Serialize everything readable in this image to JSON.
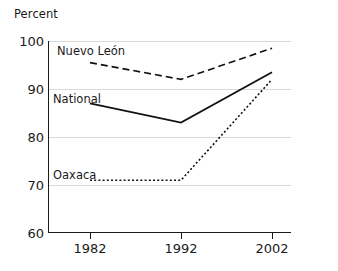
{
  "chart_data": {
    "type": "line",
    "title": "",
    "xlabel": "",
    "ylabel": "Percent",
    "ylim": [
      60,
      100
    ],
    "yticks": [
      60,
      70,
      80,
      90,
      100
    ],
    "categories": [
      "1982",
      "1992",
      "2002"
    ],
    "x": [
      1982,
      1992,
      2002
    ],
    "grid": "horizontal",
    "legend_position": "inline-labels",
    "series": [
      {
        "name": "Nuevo León",
        "values": [
          95.5,
          92.0,
          98.5
        ],
        "style": "dashed",
        "color": "#111111"
      },
      {
        "name": "National",
        "values": [
          87.0,
          83.0,
          93.5
        ],
        "style": "solid",
        "color": "#111111"
      },
      {
        "name": "Oaxaca",
        "values": [
          71.0,
          71.0,
          92.0
        ],
        "style": "dotted",
        "color": "#111111"
      }
    ]
  },
  "axis": {
    "y_caption": "Percent",
    "y_tick_labels": [
      "100",
      "90",
      "80",
      "70",
      "60"
    ],
    "x_tick_labels": [
      "1982",
      "1992",
      "2002"
    ]
  },
  "series_labels": {
    "nuevo_leon": "Nuevo León",
    "national": "National",
    "oaxaca": "Oaxaca"
  },
  "colors": {
    "ink": "#1a1a1a",
    "gridline": "#d9d9d9",
    "background": "#ffffff"
  }
}
